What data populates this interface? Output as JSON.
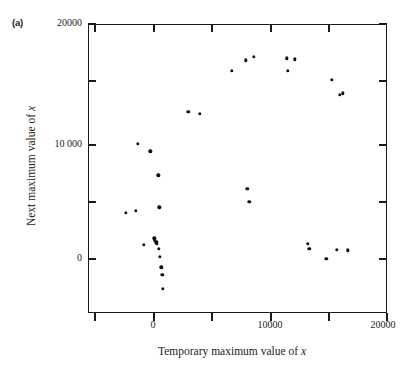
{
  "figure": {
    "panel_label": "(a)",
    "background_color": "#ffffff",
    "marker_color": "#111111",
    "axis_color": "#1a1a1a"
  },
  "chart_data": {
    "type": "scatter",
    "title": "",
    "xlabel": "Temporary maximum value of x",
    "ylabel": "Next maximum value of x",
    "xlabel_italic_tail": "x",
    "ylabel_italic_tail": "x",
    "xlim": [
      -5600,
      20000
    ],
    "ylim": [
      -5400,
      20000
    ],
    "xticks": [
      0,
      10000,
      20000
    ],
    "xticklabels": [
      "0",
      "10000",
      "20000"
    ],
    "yticks": [
      0,
      10000,
      20000
    ],
    "yticklabels": [
      "0",
      "10 000",
      "20000"
    ],
    "minor_xticks": [
      -5000,
      5000,
      15000
    ],
    "minor_yticks": [
      -5000,
      5000,
      15000
    ],
    "grid": false,
    "legend": null,
    "series": [
      {
        "name": "next vs temporary maximum",
        "points": [
          [
            -2370,
            3400
          ],
          [
            -1520,
            3560
          ],
          [
            -1340,
            9450
          ],
          [
            -800,
            600
          ],
          [
            -250,
            8800
          ],
          [
            60,
            1150
          ],
          [
            130,
            980
          ],
          [
            250,
            830
          ],
          [
            300,
            700
          ],
          [
            420,
            6700
          ],
          [
            480,
            250
          ],
          [
            520,
            3900
          ],
          [
            560,
            -450
          ],
          [
            660,
            -1380
          ],
          [
            760,
            -2050
          ],
          [
            820,
            -3250
          ],
          [
            3000,
            12300
          ],
          [
            3950,
            12100
          ],
          [
            6700,
            15900
          ],
          [
            7900,
            16800
          ],
          [
            8050,
            5500
          ],
          [
            8200,
            4350
          ],
          [
            8600,
            17100
          ],
          [
            11400,
            17000
          ],
          [
            11500,
            15900
          ],
          [
            12100,
            16900
          ],
          [
            13200,
            700
          ],
          [
            13350,
            250
          ],
          [
            14800,
            -650
          ],
          [
            15250,
            15100
          ],
          [
            15950,
            13800
          ],
          [
            16200,
            13900
          ],
          [
            15700,
            150
          ],
          [
            16650,
            100
          ]
        ]
      }
    ]
  }
}
